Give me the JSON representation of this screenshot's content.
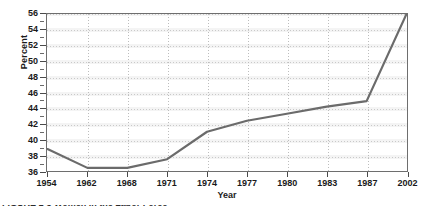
{
  "chart_data": {
    "type": "line",
    "title": "",
    "xlabel": "Year",
    "ylabel": "Percent",
    "categories": [
      "1954",
      "1962",
      "1968",
      "1971",
      "1974",
      "1977",
      "1980",
      "1983",
      "1987",
      "2002"
    ],
    "values": [
      38.8,
      36.4,
      36.4,
      37.5,
      41.0,
      42.4,
      43.3,
      44.2,
      44.9,
      56.0
    ],
    "series": [
      {
        "name": "Percent",
        "values": [
          38.8,
          36.4,
          36.4,
          37.5,
          41.0,
          42.4,
          43.3,
          44.2,
          44.9,
          56.0
        ]
      }
    ],
    "ylim": [
      36,
      56
    ],
    "ytick_step": 2,
    "yticks": [
      36,
      38,
      40,
      42,
      44,
      46,
      48,
      50,
      52,
      54,
      56
    ],
    "ytick_labels": [
      "36",
      "38",
      "40",
      "42",
      "44",
      "46",
      "48",
      "50",
      "52",
      "54",
      "56"
    ],
    "xticks": [
      "1954",
      "1962",
      "1968",
      "1971",
      "1974",
      "1977",
      "1980",
      "1983",
      "1987",
      "2002"
    ],
    "grid": true,
    "grid_orientation": "both",
    "legend": false,
    "legend_position": "none",
    "line_color": "#6b6b6b",
    "grid_color": "#c9c9c9",
    "band_color": "#f4f4f4",
    "axis_color": "#6e6e6e",
    "text_color": "#1a1a1a",
    "background": "#ffffff"
  },
  "caption": {
    "fragment_text": "FIGURE 1-3 Women in the Labor Force"
  }
}
